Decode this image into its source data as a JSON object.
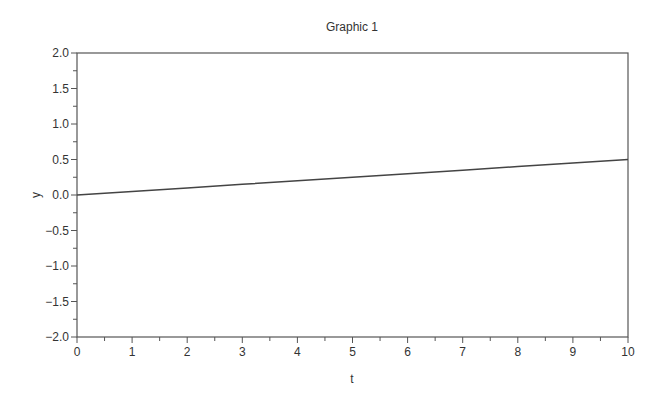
{
  "chart_data": {
    "type": "line",
    "title": "Graphic 1",
    "xlabel": "t",
    "ylabel": "y",
    "xlim": [
      0,
      10
    ],
    "ylim": [
      -2.0,
      2.0
    ],
    "x_ticks": [
      "0",
      "1",
      "2",
      "3",
      "4",
      "5",
      "6",
      "7",
      "8",
      "9",
      "10"
    ],
    "y_ticks": [
      "2.0",
      "1.5",
      "1.0",
      "0.5",
      "0.0",
      "−0.5",
      "−1.0",
      "−1.5",
      "−2.0"
    ],
    "grid": false,
    "legend": null,
    "series": [
      {
        "name": "y",
        "color": "#444444",
        "x": [
          0,
          1,
          2,
          3,
          4,
          5,
          6,
          7,
          8,
          9,
          10
        ],
        "values": [
          0.0,
          0.05,
          0.1,
          0.15,
          0.2,
          0.25,
          0.3,
          0.35,
          0.4,
          0.45,
          0.5
        ]
      }
    ]
  }
}
